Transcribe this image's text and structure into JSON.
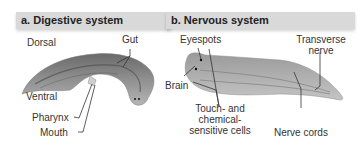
{
  "panel_a": {
    "title": "a. Digestive system",
    "labels": {
      "dorsal": "Dorsal",
      "gut": "Gut",
      "ventral": "Ventral",
      "pharynx": "Pharynx",
      "mouth": "Mouth"
    }
  },
  "panel_b": {
    "title": "b. Nervous system",
    "labels": {
      "eyespots": "Eyespots",
      "brain": "Brain",
      "transverse_line1": "Transverse",
      "transverse_line2": "nerve",
      "touch_line1": "Touch- and",
      "touch_line2": "chemical-",
      "touch_line3": "sensitive cells",
      "nerve_cords": "Nerve cords"
    }
  },
  "colors": {
    "header_bg": "#d9d9d9",
    "worm_body": "#8a8a8a",
    "worm_dark": "#5e5e5e",
    "leader_line": "#333333"
  }
}
